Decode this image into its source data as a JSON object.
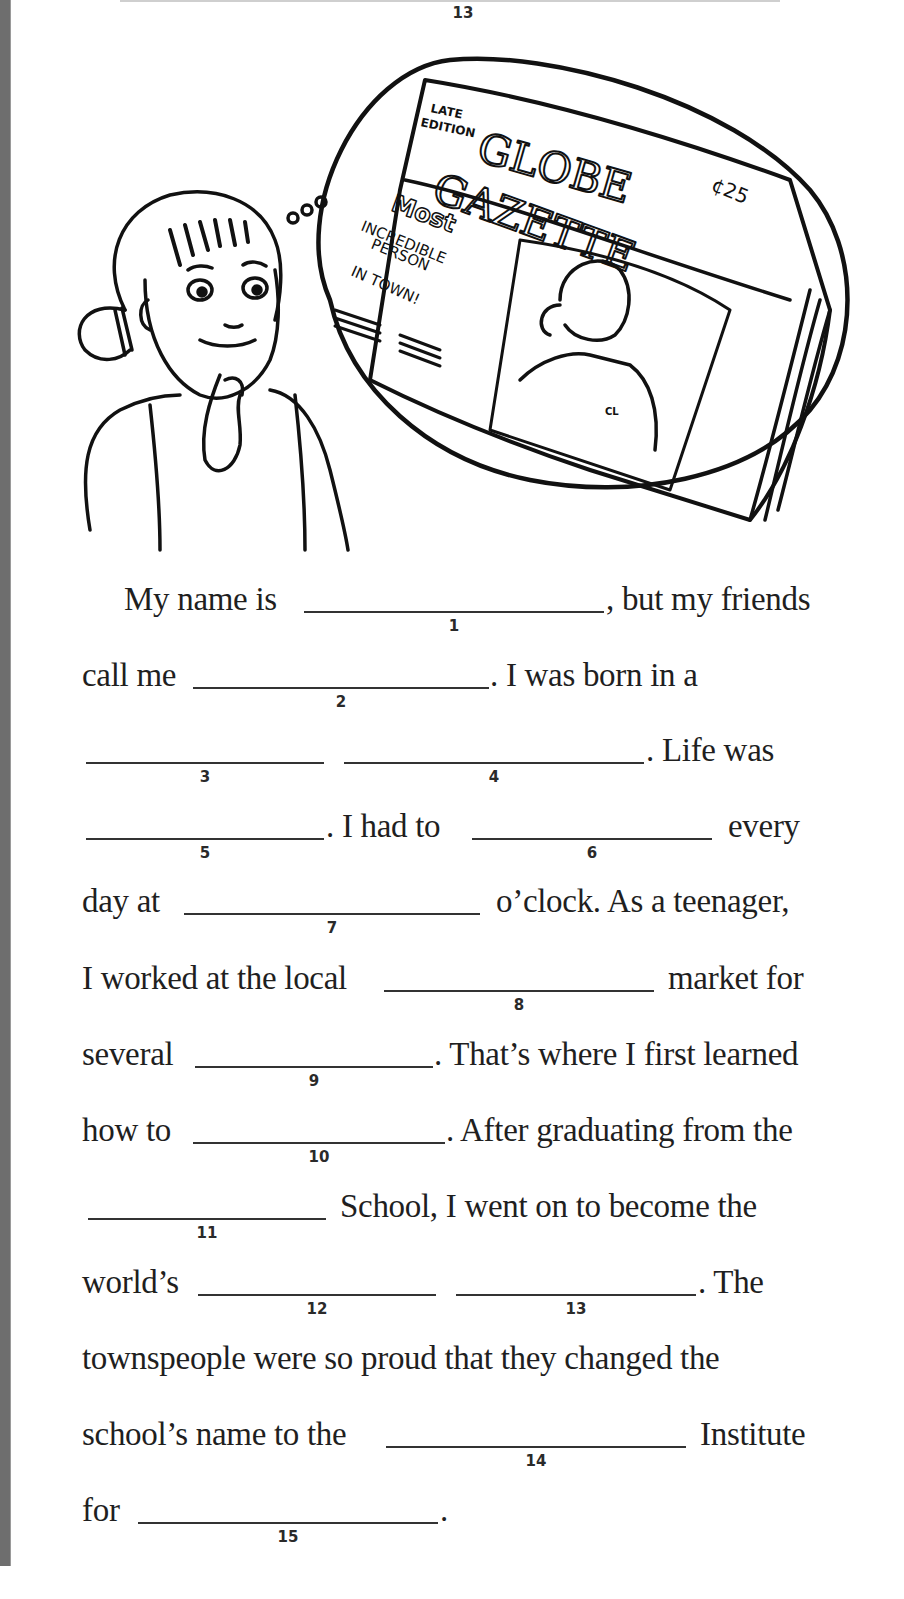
{
  "header": {
    "previous_blank_number": "13"
  },
  "illustration": {
    "thought_bubble_sound": "ooo",
    "newspaper": {
      "edition": [
        "LATE",
        "EDITION"
      ],
      "masthead": [
        "GLOBE",
        "GAZETTE"
      ],
      "price": "¢25",
      "headline": [
        "Most",
        "INCREDIBLE",
        "PERSON",
        "IN TOWN!"
      ],
      "shirt_initials": "CL"
    }
  },
  "story": {
    "lines": [
      {
        "y": 611,
        "segments": [
          {
            "type": "text",
            "x": 124,
            "text": "My name is"
          },
          {
            "type": "blank",
            "x": 304,
            "w": 300,
            "num": "1"
          },
          {
            "type": "text",
            "x": 606,
            "text": ", but my friends"
          }
        ]
      },
      {
        "y": 687,
        "segments": [
          {
            "type": "text",
            "x": 82,
            "text": "call me"
          },
          {
            "type": "blank",
            "x": 193,
            "w": 296,
            "num": "2"
          },
          {
            "type": "text",
            "x": 490,
            "text": ". I was born in a"
          }
        ]
      },
      {
        "y": 762,
        "segments": [
          {
            "type": "blank",
            "x": 86,
            "w": 238,
            "num": "3"
          },
          {
            "type": "blank",
            "x": 344,
            "w": 300,
            "num": "4"
          },
          {
            "type": "text",
            "x": 646,
            "text": ". Life was"
          }
        ]
      },
      {
        "y": 838,
        "segments": [
          {
            "type": "blank",
            "x": 86,
            "w": 238,
            "num": "5"
          },
          {
            "type": "text",
            "x": 326,
            "text": ". I had to"
          },
          {
            "type": "blank",
            "x": 472,
            "w": 240,
            "num": "6"
          },
          {
            "type": "text",
            "x": 728,
            "text": "every"
          }
        ]
      },
      {
        "y": 913,
        "segments": [
          {
            "type": "text",
            "x": 82,
            "text": "day at"
          },
          {
            "type": "blank",
            "x": 184,
            "w": 296,
            "num": "7"
          },
          {
            "type": "text",
            "x": 496,
            "text": "o’clock. As a teenager,"
          }
        ]
      },
      {
        "y": 990,
        "segments": [
          {
            "type": "text",
            "x": 82,
            "text": "I worked at the local"
          },
          {
            "type": "blank",
            "x": 384,
            "w": 270,
            "num": "8"
          },
          {
            "type": "text",
            "x": 668,
            "text": "market for"
          }
        ]
      },
      {
        "y": 1066,
        "segments": [
          {
            "type": "text",
            "x": 82,
            "text": "several"
          },
          {
            "type": "blank",
            "x": 195,
            "w": 238,
            "num": "9"
          },
          {
            "type": "text",
            "x": 434,
            "text": ". That’s where I first learned"
          }
        ]
      },
      {
        "y": 1142,
        "segments": [
          {
            "type": "text",
            "x": 82,
            "text": "how to"
          },
          {
            "type": "blank",
            "x": 193,
            "w": 252,
            "num": "10"
          },
          {
            "type": "text",
            "x": 446,
            "text": ". After graduating from the"
          }
        ]
      },
      {
        "y": 1218,
        "segments": [
          {
            "type": "blank",
            "x": 88,
            "w": 238,
            "num": "11"
          },
          {
            "type": "text",
            "x": 340,
            "text": "School, I went on to become the"
          }
        ]
      },
      {
        "y": 1294,
        "segments": [
          {
            "type": "text",
            "x": 82,
            "text": "world’s"
          },
          {
            "type": "blank",
            "x": 198,
            "w": 238,
            "num": "12"
          },
          {
            "type": "blank",
            "x": 456,
            "w": 240,
            "num": "13"
          },
          {
            "type": "text",
            "x": 698,
            "text": ". The"
          }
        ]
      },
      {
        "y": 1370,
        "segments": [
          {
            "type": "text",
            "x": 82,
            "text": "townspeople were so proud that they changed the"
          }
        ]
      },
      {
        "y": 1446,
        "segments": [
          {
            "type": "text",
            "x": 82,
            "text": "school’s name to the"
          },
          {
            "type": "blank",
            "x": 386,
            "w": 300,
            "num": "14"
          },
          {
            "type": "text",
            "x": 700,
            "text": "Institute"
          }
        ]
      },
      {
        "y": 1522,
        "segments": [
          {
            "type": "text",
            "x": 82,
            "text": "for"
          },
          {
            "type": "blank",
            "x": 138,
            "w": 300,
            "num": "15"
          },
          {
            "type": "text",
            "x": 440,
            "text": "."
          }
        ]
      }
    ]
  },
  "colors": {
    "ink": "#1f1f1f",
    "left_bar": "#6e6e6e",
    "paper": "#ffffff"
  }
}
